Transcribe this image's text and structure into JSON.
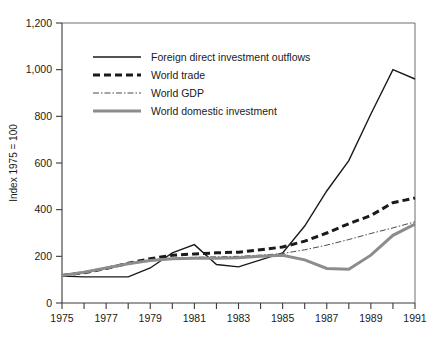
{
  "chart_data": {
    "type": "line",
    "title": "",
    "xlabel": "",
    "ylabel": "Index 1975 = 100",
    "xlim": [
      1975,
      1991
    ],
    "ylim": [
      0,
      1200
    ],
    "ytick_step": 200,
    "grid": false,
    "legend_position": "top-left-inside",
    "x": [
      1975,
      1976,
      1977,
      1978,
      1979,
      1980,
      1981,
      1982,
      1983,
      1984,
      1985,
      1986,
      1987,
      1988,
      1989,
      1990,
      1991
    ],
    "xtick_labels": [
      "1975",
      "",
      "1977",
      "",
      "1979",
      "",
      "1981",
      "",
      "1983",
      "",
      "1985",
      "",
      "1987",
      "",
      "1989",
      "",
      "1991"
    ],
    "ytick_labels": [
      "0",
      "200",
      "400",
      "600",
      "800",
      "1,000",
      "1,200"
    ],
    "ytick_values": [
      0,
      200,
      400,
      600,
      800,
      1000,
      1200
    ],
    "series": [
      {
        "name": "Foreign direct investment outflows",
        "style": "solid-thin",
        "color": "#1a1a1a",
        "width": 1.4,
        "dash": "",
        "values": [
          115,
          112,
          112,
          112,
          150,
          215,
          250,
          165,
          155,
          185,
          215,
          330,
          480,
          610,
          810,
          1000,
          960
        ]
      },
      {
        "name": "World trade",
        "style": "dashed-thick",
        "color": "#1a1a1a",
        "width": 3.0,
        "dash": "7,4",
        "values": [
          118,
          130,
          148,
          170,
          190,
          205,
          210,
          215,
          218,
          228,
          240,
          265,
          300,
          340,
          375,
          430,
          450
        ]
      },
      {
        "name": "World GDP",
        "style": "dashdot-thin",
        "color": "#4a4a4a",
        "width": 1.0,
        "dash": "6,2,1.5,2",
        "values": [
          118,
          132,
          150,
          168,
          183,
          192,
          196,
          198,
          200,
          205,
          212,
          228,
          248,
          272,
          298,
          322,
          348
        ]
      },
      {
        "name": "World domestic investment",
        "style": "solid-thick-gray",
        "color": "#8c8c8c",
        "width": 3.0,
        "dash": "",
        "values": [
          118,
          132,
          150,
          168,
          182,
          190,
          192,
          192,
          194,
          200,
          205,
          185,
          148,
          145,
          205,
          290,
          338
        ]
      }
    ]
  },
  "axis": {
    "y_title": "Index 1975 = 100"
  }
}
